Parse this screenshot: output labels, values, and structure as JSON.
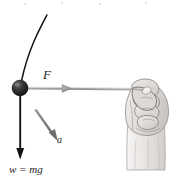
{
  "figure": {
    "background_color": "#ffffff",
    "ink_color": "#1a1a1a",
    "vector_color": "#8c8c8c",
    "labels": {
      "force": "F",
      "acceleration": "a",
      "weight": "w = mg"
    },
    "elements": [
      {
        "name": "ball",
        "kind": "filled-circle",
        "color": "#1a1a1a",
        "cx": 20,
        "cy": 88,
        "r": 8
      },
      {
        "name": "string-curve",
        "kind": "curve",
        "color": "#1a1a1a",
        "from_x": 47,
        "from_y": 15,
        "to_x": 20,
        "to_y": 82
      },
      {
        "name": "force-vector",
        "kind": "arrow",
        "color": "#8c8c8c",
        "from_x": 22,
        "from_y": 88,
        "to_x": 70,
        "to_y": 88,
        "label": "F"
      },
      {
        "name": "string-to-hand",
        "kind": "line",
        "color": "#8c8c8c",
        "from_x": 70,
        "from_y": 88,
        "to_x": 136,
        "to_y": 89
      },
      {
        "name": "weight-vector",
        "kind": "arrow",
        "color": "#1a1a1a",
        "from_x": 20,
        "from_y": 92,
        "to_x": 20,
        "to_y": 158,
        "label": "w = mg"
      },
      {
        "name": "acceleration-vector",
        "kind": "arrow",
        "color": "#7a7a7a",
        "from_x": 36,
        "from_y": 110,
        "to_x": 57,
        "to_y": 140,
        "label": "a"
      },
      {
        "name": "hand",
        "kind": "illustration",
        "description": "closed fist gripping the string, with forearm below",
        "x": 122,
        "y": 76,
        "width": 48,
        "height": 95
      }
    ]
  }
}
